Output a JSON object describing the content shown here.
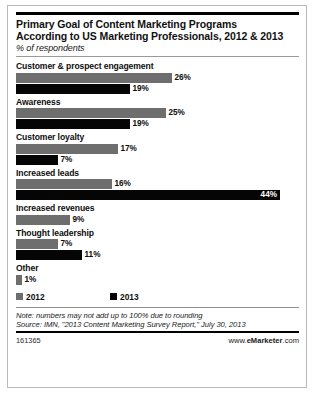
{
  "chart_data": {
    "type": "bar",
    "orientation": "horizontal",
    "title": "Primary Goal of Content Marketing Programs According to US Marketing Professionals, 2012 & 2013",
    "title_line1": "Primary Goal of Content Marketing Programs",
    "title_line2": "According to US Marketing Professionals, 2012 & 2013",
    "subtitle": "% of respondents",
    "xlabel": "",
    "ylabel": "",
    "xlim": [
      0,
      46
    ],
    "grid": false,
    "legend_position": "bottom-left",
    "categories": [
      "Customer & prospect engagement",
      "Awareness",
      "Customer loyalty",
      "Increased leads",
      "Increased revenues",
      "Thought leadership",
      "Other"
    ],
    "series": [
      {
        "name": "2012",
        "color": "#6e6e6e",
        "values": [
          26,
          25,
          17,
          16,
          9,
          7,
          1
        ]
      },
      {
        "name": "2013",
        "color": "#050505",
        "values": [
          19,
          19,
          7,
          44,
          null,
          11,
          null
        ]
      }
    ],
    "value_labels": {
      "2012": [
        "26%",
        "25%",
        "17%",
        "16%",
        "9%",
        "7%",
        "1%"
      ],
      "2013": [
        "19%",
        "19%",
        "7%",
        "44%",
        null,
        "11%",
        null
      ]
    },
    "groups": [
      {
        "label": "Customer & prospect engagement",
        "bars": [
          {
            "series": "2012",
            "value": 26,
            "label": "26%",
            "label_position": "outside"
          },
          {
            "series": "2013",
            "value": 19,
            "label": "19%",
            "label_position": "outside"
          }
        ]
      },
      {
        "label": "Awareness",
        "bars": [
          {
            "series": "2012",
            "value": 25,
            "label": "25%",
            "label_position": "outside"
          },
          {
            "series": "2013",
            "value": 19,
            "label": "19%",
            "label_position": "outside"
          }
        ]
      },
      {
        "label": "Customer loyalty",
        "bars": [
          {
            "series": "2012",
            "value": 17,
            "label": "17%",
            "label_position": "outside"
          },
          {
            "series": "2013",
            "value": 7,
            "label": "7%",
            "label_position": "outside"
          }
        ]
      },
      {
        "label": "Increased leads",
        "bars": [
          {
            "series": "2012",
            "value": 16,
            "label": "16%",
            "label_position": "outside"
          },
          {
            "series": "2013",
            "value": 44,
            "label": "44%",
            "label_position": "inside"
          }
        ]
      },
      {
        "label": "Increased revenues",
        "bars": [
          {
            "series": "2012",
            "value": 9,
            "label": "9%",
            "label_position": "outside"
          }
        ]
      },
      {
        "label": "Thought leadership",
        "bars": [
          {
            "series": "2012",
            "value": 7,
            "label": "7%",
            "label_position": "outside"
          },
          {
            "series": "2013",
            "value": 11,
            "label": "11%",
            "label_position": "outside"
          }
        ]
      },
      {
        "label": "Other",
        "bars": [
          {
            "series": "2012",
            "value": 1,
            "label": "1%",
            "label_position": "outside"
          }
        ]
      }
    ]
  },
  "legend": [
    {
      "label": "2012",
      "color": "#6e6e6e"
    },
    {
      "label": "2013",
      "color": "#050505"
    }
  ],
  "footer": {
    "note": "Note: numbers may not add up to 100% due to rounding",
    "source": "Source: IMN, \"2013 Content Marketing Survey Report,\" July 30, 2013",
    "chart_id": "161365",
    "brand_prefix": "www.",
    "brand_name": "eMarketer",
    "brand_suffix": ".com"
  }
}
